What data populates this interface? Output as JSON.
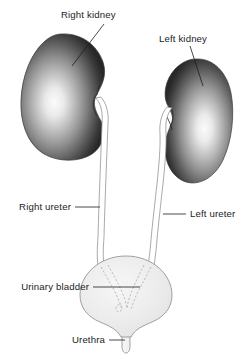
{
  "figure": {
    "type": "anatomical-diagram",
    "background_color": "#ffffff"
  },
  "labels": {
    "right_kidney": "Right kidney",
    "left_kidney": "Left kidney",
    "right_ureter": "Right ureter",
    "left_ureter": "Left ureter",
    "urinary_bladder": "Urinary bladder",
    "urethra": "Urethra"
  },
  "colors": {
    "organ_dark": "#2a2a2a",
    "organ_mid": "#8f8f8f",
    "organ_highlight": "#f7f7f7",
    "bladder_fill": "#ececec",
    "outline": "#3a3a3a",
    "tube_outline": "#8c8c8c",
    "dashed_stroke": "#a9a9a9",
    "text": "#1c1c1c"
  },
  "structures": [
    {
      "name": "right-kidney",
      "side": "right",
      "shape": "bean",
      "shading": "radial-gradient"
    },
    {
      "name": "left-kidney",
      "side": "left",
      "shape": "bean",
      "shading": "radial-gradient"
    },
    {
      "name": "right-ureter",
      "shape": "tube"
    },
    {
      "name": "left-ureter",
      "shape": "tube"
    },
    {
      "name": "urinary-bladder",
      "shape": "sphere"
    },
    {
      "name": "urethra",
      "shape": "funnel-tube"
    }
  ]
}
